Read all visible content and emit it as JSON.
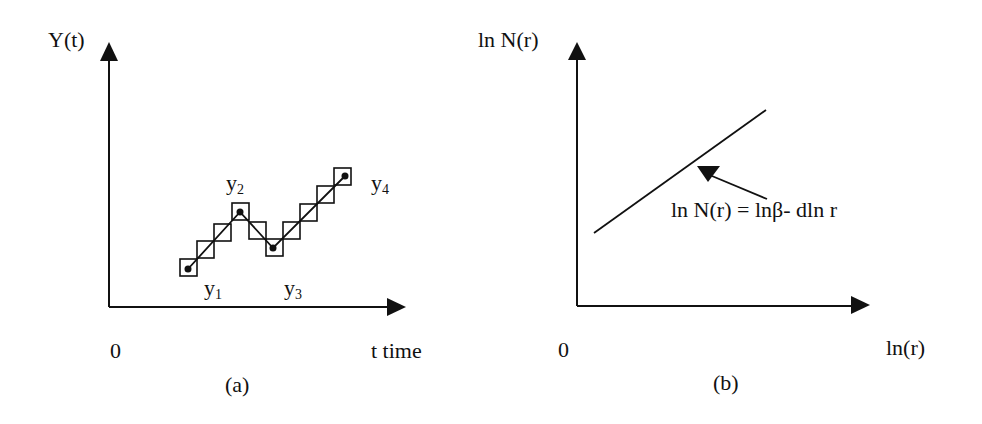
{
  "panel_a": {
    "caption": "(a)",
    "y_axis_label": "Y(t)",
    "x_axis_label": "t time",
    "origin_label": "0",
    "points": [
      {
        "base": "y",
        "sub": "1"
      },
      {
        "base": "y",
        "sub": "2"
      },
      {
        "base": "y",
        "sub": "3"
      },
      {
        "base": "y",
        "sub": "4"
      }
    ]
  },
  "panel_b": {
    "caption": "(b)",
    "y_axis_label": "ln N(r)",
    "x_axis_label": "ln(r)",
    "origin_label": "0",
    "equation": "ln N(r) = lnβ- dln r"
  },
  "colors": {
    "ink": "#111111",
    "background": "#ffffff"
  }
}
